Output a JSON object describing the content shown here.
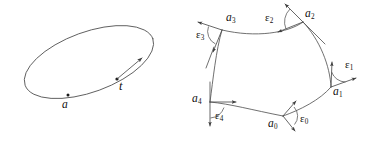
{
  "figure": {
    "background_color": "#ffffff",
    "stroke_color": "#565656",
    "label_color": "#111111",
    "panels": [
      {
        "name": "left-panel",
        "description": "smooth closed curve (tilted ellipse) with a marked point and a tangent vector",
        "point_label": "a",
        "tangent_label": "t"
      },
      {
        "name": "right-panel",
        "description": "piecewise-smooth closed curve with five corner vertices and exterior turning angles",
        "vertex_labels": [
          "a",
          "a",
          "a",
          "a",
          "a"
        ],
        "vertex_subscripts": [
          "0",
          "1",
          "2",
          "3",
          "4"
        ],
        "angle_label": "ε",
        "angle_subscripts": [
          "0",
          "1",
          "2",
          "3",
          "4"
        ]
      }
    ]
  },
  "left": {
    "point_a": "a",
    "tangent_t": "t"
  },
  "right": {
    "a0": "a",
    "a0_sub": "0",
    "a1": "a",
    "a1_sub": "1",
    "a2": "a",
    "a2_sub": "2",
    "a3": "a",
    "a3_sub": "3",
    "a4": "a",
    "a4_sub": "4",
    "e0": "ε",
    "e0_sub": "0",
    "e1": "ε",
    "e1_sub": "1",
    "e2": "ε",
    "e2_sub": "2",
    "e3": "ε",
    "e3_sub": "3",
    "e4": "ε",
    "e4_sub": "4"
  }
}
